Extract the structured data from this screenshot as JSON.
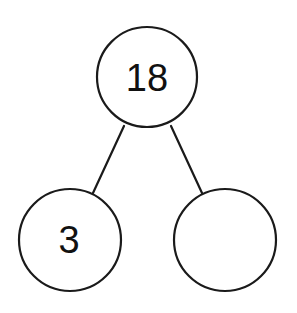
{
  "diagram": {
    "type": "number-bond",
    "stroke_color": "#1a1a1a",
    "background_color": "#ffffff",
    "nodes": {
      "whole": {
        "label": "18",
        "cx": 147,
        "cy": 77,
        "r": 50
      },
      "part_left": {
        "label": "3",
        "cx": 70,
        "cy": 240,
        "r": 51
      },
      "part_right": {
        "label": "",
        "cx": 225,
        "cy": 240,
        "r": 51
      }
    },
    "edges": [
      {
        "from": "whole",
        "to": "part_left",
        "x1": 124,
        "y1": 126,
        "x2": 93,
        "y2": 193
      },
      {
        "from": "whole",
        "to": "part_right",
        "x1": 171,
        "y1": 126,
        "x2": 202,
        "y2": 193
      }
    ]
  }
}
